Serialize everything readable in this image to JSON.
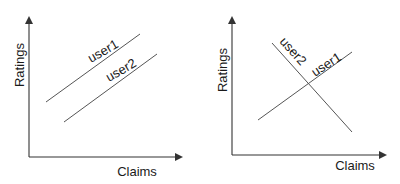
{
  "panels": [
    {
      "id": "left",
      "xlabel": "Claims",
      "ylabel": "Ratings",
      "series": [
        {
          "name": "user1",
          "label": "user1",
          "trend": "increasing"
        },
        {
          "name": "user2",
          "label": "user2",
          "trend": "increasing"
        }
      ],
      "description": "Two parallel increasing lines"
    },
    {
      "id": "right",
      "xlabel": "Claims",
      "ylabel": "Ratings",
      "series": [
        {
          "name": "user1",
          "label": "user1",
          "trend": "increasing"
        },
        {
          "name": "user2",
          "label": "user2",
          "trend": "decreasing"
        }
      ],
      "description": "Two crossing lines"
    }
  ],
  "colors": {
    "axis": "#333333",
    "line": "#555555",
    "text": "#1a1a1a"
  }
}
